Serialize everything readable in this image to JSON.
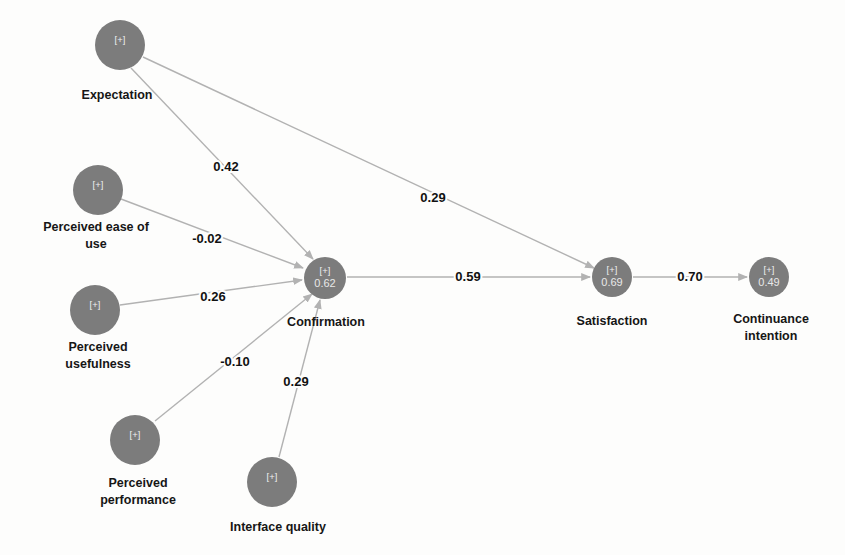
{
  "diagram": {
    "type": "sem-path-diagram",
    "title": "",
    "background_color": "#fdfdfc",
    "node_fill_color": "#7c7c7c",
    "node_text_color": "#e8e8e8",
    "edge_color": "#b2b2b2",
    "label_color": "#161616",
    "plus_marker": "[+]"
  },
  "nodes": [
    {
      "id": "expectation",
      "label": "Expectation",
      "label_lines": [
        "Expectation"
      ],
      "value": "",
      "marker": "[+]",
      "cx": 120,
      "cy": 45,
      "r": 25,
      "label_x": 117,
      "label_y": 96
    },
    {
      "id": "perceived_ease_of_use",
      "label": "Perceived ease of use",
      "label_lines": [
        "Perceived ease of",
        "use"
      ],
      "value": "",
      "marker": "[+]",
      "cx": 98,
      "cy": 190,
      "r": 25,
      "label_x": 96,
      "label_y": 228
    },
    {
      "id": "perceived_usefulness",
      "label": "Perceived usefulness",
      "label_lines": [
        "Perceived",
        "usefulness"
      ],
      "value": "",
      "marker": "[+]",
      "cx": 95,
      "cy": 310,
      "r": 25,
      "label_x": 98,
      "label_y": 348
    },
    {
      "id": "perceived_performance",
      "label": "Perceived performance",
      "label_lines": [
        "Perceived",
        "performance"
      ],
      "value": "",
      "marker": "[+]",
      "cx": 135,
      "cy": 440,
      "r": 25,
      "label_x": 138,
      "label_y": 484
    },
    {
      "id": "interface_quality",
      "label": "Interface quality",
      "label_lines": [
        "Interface quality"
      ],
      "value": "",
      "marker": "[+]",
      "cx": 272,
      "cy": 482,
      "r": 25,
      "label_x": 278,
      "label_y": 528
    },
    {
      "id": "confirmation",
      "label": "Confirmation",
      "label_lines": [
        "Confirmation"
      ],
      "value": "0.62",
      "marker": "[+]",
      "cx": 325,
      "cy": 278,
      "r": 21,
      "label_x": 326,
      "label_y": 323
    },
    {
      "id": "satisfaction",
      "label": "Satisfaction",
      "label_lines": [
        "Satisfaction"
      ],
      "value": "0.69",
      "marker": "[+]",
      "cx": 612,
      "cy": 277,
      "r": 20,
      "label_x": 612,
      "label_y": 322
    },
    {
      "id": "continuance_intention",
      "label": "Continuance intention",
      "label_lines": [
        "Continuance",
        "intention"
      ],
      "value": "0.49",
      "marker": "[+]",
      "cx": 769,
      "cy": 277,
      "r": 20,
      "label_x": 771,
      "label_y": 320
    }
  ],
  "edges": [
    {
      "id": "expectation-confirmation",
      "from": "expectation",
      "to": "confirmation",
      "coefficient": "0.42",
      "x1": 131,
      "y1": 68,
      "x2": 313,
      "y2": 259,
      "label_x": 226,
      "label_y": 168
    },
    {
      "id": "expectation-satisfaction",
      "from": "expectation",
      "to": "satisfaction",
      "coefficient": "0.29",
      "x1": 143,
      "y1": 57,
      "x2": 594,
      "y2": 268,
      "label_x": 433,
      "label_y": 199
    },
    {
      "id": "perceived-ease-of-use-confirmation",
      "from": "perceived_ease_of_use",
      "to": "confirmation",
      "coefficient": "-0.02",
      "x1": 121,
      "y1": 199,
      "x2": 303,
      "y2": 268,
      "label_x": 207,
      "label_y": 240
    },
    {
      "id": "perceived-usefulness-confirmation",
      "from": "perceived_usefulness",
      "to": "confirmation",
      "coefficient": "0.26",
      "x1": 120,
      "y1": 305,
      "x2": 302,
      "y2": 280,
      "label_x": 213,
      "label_y": 298
    },
    {
      "id": "perceived-performance-confirmation",
      "from": "perceived_performance",
      "to": "confirmation",
      "coefficient": "-0.10",
      "x1": 155,
      "y1": 421,
      "x2": 312,
      "y2": 294,
      "label_x": 235,
      "label_y": 363
    },
    {
      "id": "interface-quality-confirmation",
      "from": "interface_quality",
      "to": "confirmation",
      "coefficient": "0.29",
      "x1": 279,
      "y1": 457,
      "x2": 320,
      "y2": 300,
      "label_x": 296,
      "label_y": 383
    },
    {
      "id": "confirmation-satisfaction",
      "from": "confirmation",
      "to": "satisfaction",
      "coefficient": "0.59",
      "x1": 347,
      "y1": 277,
      "x2": 590,
      "y2": 277,
      "label_x": 468,
      "label_y": 278
    },
    {
      "id": "satisfaction-continuance-intention",
      "from": "satisfaction",
      "to": "continuance_intention",
      "coefficient": "0.70",
      "x1": 633,
      "y1": 277,
      "x2": 747,
      "y2": 277,
      "label_x": 690,
      "label_y": 278
    }
  ]
}
